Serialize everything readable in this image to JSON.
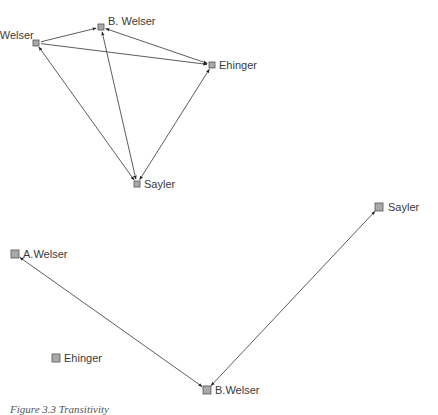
{
  "graphs": [
    {
      "name": "directed-graph",
      "nodes": [
        {
          "id": "aw",
          "label": "A. Welser",
          "x": 36,
          "y": 43,
          "size": 6,
          "label_dx": -26,
          "label_dy": -4
        },
        {
          "id": "bw",
          "label": "B. Welser",
          "x": 101,
          "y": 27,
          "size": 6,
          "label_dx": 7,
          "label_dy": -2
        },
        {
          "id": "eh",
          "label": "Ehinger",
          "x": 212,
          "y": 65,
          "size": 6,
          "label_dx": 7,
          "label_dy": 4
        },
        {
          "id": "sa",
          "label": "Sayler",
          "x": 137,
          "y": 184,
          "size": 6,
          "label_dx": 7,
          "label_dy": 4
        }
      ],
      "edges": [
        {
          "from": "aw",
          "to": "bw",
          "bidirectional": false
        },
        {
          "from": "aw",
          "to": "eh",
          "bidirectional": false
        },
        {
          "from": "bw",
          "to": "eh",
          "bidirectional": true
        },
        {
          "from": "aw",
          "to": "sa",
          "bidirectional": true
        },
        {
          "from": "bw",
          "to": "sa",
          "bidirectional": true
        },
        {
          "from": "eh",
          "to": "sa",
          "bidirectional": true
        }
      ]
    },
    {
      "name": "undirected-graph",
      "nodes": [
        {
          "id": "aw",
          "label": "A.Welser",
          "x": 15,
          "y": 254,
          "size": 8,
          "label_dx": 8,
          "label_dy": 4
        },
        {
          "id": "eh",
          "label": "Ehinger",
          "x": 56,
          "y": 358,
          "size": 8,
          "label_dx": 8,
          "label_dy": 4
        },
        {
          "id": "bw",
          "label": "B.Welser",
          "x": 207,
          "y": 390,
          "size": 8,
          "label_dx": 8,
          "label_dy": 4
        },
        {
          "id": "sa",
          "label": "Sayler",
          "x": 379,
          "y": 207,
          "size": 8,
          "label_dx": 9,
          "label_dy": 4
        }
      ],
      "edges": [
        {
          "from": "aw",
          "to": "bw",
          "bidirectional": true
        },
        {
          "from": "sa",
          "to": "bw",
          "bidirectional": true
        }
      ]
    }
  ],
  "caption": "Figure 3.3 Transitivity",
  "colors": {
    "node_fill": "#a9a9a9",
    "node_stroke": "#555555",
    "edge": "#333333"
  }
}
